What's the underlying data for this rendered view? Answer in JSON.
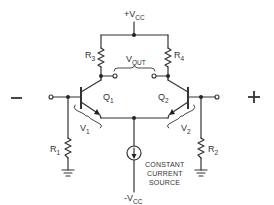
{
  "diagram": {
    "type": "differential amplifier schematic",
    "supply_top": {
      "main": "+V",
      "sub": "CC"
    },
    "supply_bottom": {
      "main": "-V",
      "sub": "CC"
    },
    "output": {
      "main": "V",
      "sub": "OUT"
    },
    "inverting_input_sign": "−",
    "noninverting_input_sign": "+",
    "transistors": [
      {
        "main": "Q",
        "sub": "1"
      },
      {
        "main": "Q",
        "sub": "2"
      }
    ],
    "resistors": {
      "r1": {
        "main": "R",
        "sub": "1"
      },
      "r2": {
        "main": "R",
        "sub": "2"
      },
      "r3": {
        "main": "R",
        "sub": "3"
      },
      "r4": {
        "main": "R",
        "sub": "4"
      }
    },
    "voltages": {
      "v1": {
        "main": "V",
        "sub": "1"
      },
      "v2": {
        "main": "V",
        "sub": "2"
      }
    },
    "current_source_label": [
      "CONSTANT",
      "CURRENT",
      "SOURCE"
    ],
    "colors": {
      "line": "#333333",
      "background": "#ffffff"
    }
  }
}
